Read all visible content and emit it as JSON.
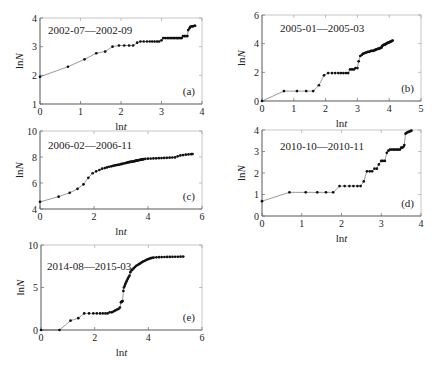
{
  "chart_data": [
    {
      "id": "a",
      "type": "line",
      "panel_label": "(a)",
      "title": "2002-07—2002-09",
      "xlabel": "lnt",
      "ylabel": "lnN",
      "xlim": [
        0,
        4
      ],
      "ylim": [
        1,
        4
      ],
      "xticks": [
        0,
        1,
        2,
        3,
        4
      ],
      "yticks": [
        1,
        2,
        3,
        4
      ],
      "grid": false,
      "box": {
        "x": 40,
        "y": 18,
        "w": 162,
        "h": 86
      },
      "x": [
        0,
        0.69,
        1.1,
        1.39,
        1.61,
        1.79,
        1.95,
        2.08,
        2.2,
        2.3,
        2.4,
        2.48,
        2.56,
        2.64,
        2.71,
        2.77,
        2.83,
        2.89,
        2.94,
        3.0,
        3.04,
        3.09,
        3.14,
        3.18,
        3.22,
        3.26,
        3.3,
        3.33,
        3.37,
        3.4,
        3.43,
        3.47,
        3.5,
        3.53,
        3.56,
        3.58,
        3.61,
        3.64,
        3.66,
        3.69,
        3.71,
        3.74,
        3.76,
        3.78,
        3.81,
        3.83
      ],
      "y": [
        1.95,
        2.3,
        2.56,
        2.77,
        2.83,
        3.0,
        3.04,
        3.04,
        3.04,
        3.04,
        3.14,
        3.18,
        3.18,
        3.18,
        3.18,
        3.18,
        3.18,
        3.18,
        3.18,
        3.22,
        3.3,
        3.3,
        3.3,
        3.3,
        3.3,
        3.3,
        3.3,
        3.3,
        3.3,
        3.3,
        3.3,
        3.3,
        3.3,
        3.37,
        3.37,
        3.37,
        3.37,
        3.37,
        3.58,
        3.64,
        3.69,
        3.71,
        3.71,
        3.71,
        3.73,
        3.73
      ]
    },
    {
      "id": "b",
      "type": "line",
      "panel_label": "(b)",
      "title": "2005-01—2005-03",
      "xlabel": "lnt",
      "ylabel": "lnN",
      "xlim": [
        0,
        5
      ],
      "ylim": [
        0,
        6
      ],
      "xticks": [
        0,
        1,
        2,
        3,
        4,
        5
      ],
      "yticks": [
        0,
        2,
        4,
        6
      ],
      "grid": false,
      "box": {
        "x": 262,
        "y": 15,
        "w": 159,
        "h": 86
      },
      "x": [
        0,
        0.69,
        1.1,
        1.39,
        1.61,
        1.79,
        1.95,
        2.08,
        2.2,
        2.3,
        2.4,
        2.48,
        2.56,
        2.64,
        2.71,
        2.77,
        2.83,
        2.89,
        2.94,
        3.0,
        3.04,
        3.09,
        3.14,
        3.18,
        3.22,
        3.26,
        3.3,
        3.33,
        3.37,
        3.4,
        3.43,
        3.47,
        3.5,
        3.53,
        3.56,
        3.58,
        3.61,
        3.64,
        3.66,
        3.69,
        3.71,
        3.74,
        3.76,
        3.78,
        3.81,
        3.83,
        3.85,
        3.87,
        3.89,
        3.91,
        3.93,
        3.95,
        3.97,
        3.99,
        4.01,
        4.03,
        4.05,
        4.07,
        4.09,
        4.11
      ],
      "y": [
        0,
        0.69,
        0.69,
        0.69,
        0.69,
        1.1,
        1.79,
        1.95,
        1.95,
        1.95,
        1.95,
        1.95,
        1.95,
        1.95,
        1.95,
        2.2,
        2.2,
        2.2,
        2.3,
        2.3,
        2.77,
        3.14,
        3.22,
        3.3,
        3.33,
        3.37,
        3.4,
        3.43,
        3.43,
        3.47,
        3.5,
        3.5,
        3.5,
        3.53,
        3.56,
        3.58,
        3.61,
        3.64,
        3.64,
        3.66,
        3.69,
        3.71,
        3.74,
        3.85,
        3.89,
        3.91,
        3.93,
        3.95,
        3.97,
        4.0,
        4.03,
        4.05,
        4.07,
        4.09,
        4.11,
        4.13,
        4.15,
        4.17,
        4.2,
        4.22
      ]
    },
    {
      "id": "c",
      "type": "line",
      "panel_label": "(c)",
      "title": "2006-02—2006-11",
      "xlabel": "lnt",
      "ylabel": "lnN",
      "xlim": [
        0,
        6
      ],
      "ylim": [
        4,
        10
      ],
      "xticks": [
        0,
        2,
        4,
        6
      ],
      "yticks": [
        4,
        6,
        8,
        10
      ],
      "grid": false,
      "box": {
        "x": 40,
        "y": 131,
        "w": 162,
        "h": 78
      },
      "x": [
        0,
        0.69,
        1.1,
        1.39,
        1.61,
        1.79,
        1.95,
        2.08,
        2.2,
        2.3,
        2.4,
        2.48,
        2.56,
        2.64,
        2.71,
        2.77,
        2.83,
        2.89,
        2.94,
        3.0,
        3.04,
        3.09,
        3.14,
        3.18,
        3.22,
        3.26,
        3.3,
        3.33,
        3.37,
        3.4,
        3.43,
        3.47,
        3.5,
        3.53,
        3.56,
        3.58,
        3.61,
        3.64,
        3.66,
        3.69,
        3.71,
        3.74,
        3.76,
        3.78,
        3.81,
        3.83,
        3.9,
        4.0,
        4.1,
        4.2,
        4.3,
        4.4,
        4.5,
        4.6,
        4.7,
        4.8,
        4.9,
        5.0,
        5.1,
        5.2,
        5.3,
        5.4,
        5.5,
        5.6,
        5.65
      ],
      "y": [
        4.55,
        4.95,
        5.25,
        5.55,
        5.9,
        6.4,
        6.75,
        6.9,
        7.0,
        7.1,
        7.15,
        7.2,
        7.25,
        7.28,
        7.32,
        7.35,
        7.38,
        7.4,
        7.42,
        7.45,
        7.47,
        7.5,
        7.52,
        7.54,
        7.56,
        7.58,
        7.6,
        7.62,
        7.63,
        7.64,
        7.65,
        7.66,
        7.68,
        7.7,
        7.72,
        7.73,
        7.74,
        7.75,
        7.76,
        7.77,
        7.78,
        7.79,
        7.8,
        7.81,
        7.82,
        7.83,
        7.85,
        7.87,
        7.88,
        7.89,
        7.9,
        7.91,
        7.92,
        7.93,
        7.94,
        7.95,
        7.96,
        7.97,
        8.05,
        8.12,
        8.15,
        8.18,
        8.2,
        8.22,
        8.23
      ]
    },
    {
      "id": "d",
      "type": "line",
      "panel_label": "(d)",
      "title": "2010-10—2010-11",
      "xlabel": "lnt",
      "ylabel": "lnN",
      "xlim": [
        0,
        4
      ],
      "ylim": [
        0,
        4
      ],
      "xticks": [
        0,
        1,
        2,
        3,
        4
      ],
      "yticks": [
        0,
        1,
        2,
        3,
        4
      ],
      "grid": false,
      "box": {
        "x": 262,
        "y": 130,
        "w": 159,
        "h": 86
      },
      "x": [
        0,
        0.69,
        1.1,
        1.39,
        1.61,
        1.79,
        1.95,
        2.08,
        2.2,
        2.3,
        2.4,
        2.48,
        2.56,
        2.64,
        2.71,
        2.77,
        2.83,
        2.89,
        2.94,
        3.0,
        3.04,
        3.09,
        3.14,
        3.18,
        3.22,
        3.26,
        3.3,
        3.33,
        3.37,
        3.4,
        3.43,
        3.47,
        3.5,
        3.53,
        3.56,
        3.58,
        3.61,
        3.64,
        3.66,
        3.69,
        3.71,
        3.74,
        3.76
      ],
      "y": [
        0.69,
        1.1,
        1.1,
        1.1,
        1.1,
        1.1,
        1.39,
        1.39,
        1.39,
        1.39,
        1.39,
        1.39,
        1.61,
        2.08,
        2.08,
        2.08,
        2.2,
        2.2,
        2.4,
        2.56,
        2.56,
        2.56,
        2.94,
        3.04,
        3.09,
        3.09,
        3.09,
        3.09,
        3.09,
        3.09,
        3.09,
        3.09,
        3.18,
        3.18,
        3.22,
        3.3,
        3.83,
        3.87,
        3.89,
        3.91,
        3.93,
        3.95,
        3.97
      ]
    },
    {
      "id": "e",
      "type": "line",
      "panel_label": "(e)",
      "title": "2014-08—2015-03",
      "xlabel": "lnt",
      "ylabel": "lnN",
      "xlim": [
        0,
        6
      ],
      "ylim": [
        0,
        10
      ],
      "xticks": [
        0,
        2,
        4,
        6
      ],
      "yticks": [
        0,
        5,
        10
      ],
      "grid": false,
      "box": {
        "x": 41,
        "y": 245,
        "w": 161,
        "h": 85
      },
      "x": [
        0,
        0.69,
        1.1,
        1.39,
        1.61,
        1.79,
        1.95,
        2.08,
        2.2,
        2.3,
        2.4,
        2.48,
        2.56,
        2.64,
        2.71,
        2.77,
        2.83,
        2.89,
        2.94,
        2.98,
        3.0,
        3.02,
        3.04,
        3.07,
        3.09,
        3.12,
        3.14,
        3.17,
        3.2,
        3.23,
        3.26,
        3.3,
        3.33,
        3.37,
        3.4,
        3.45,
        3.5,
        3.55,
        3.6,
        3.65,
        3.7,
        3.75,
        3.8,
        3.85,
        3.9,
        3.95,
        4.0,
        4.05,
        4.1,
        4.15,
        4.2,
        4.3,
        4.4,
        4.5,
        4.6,
        4.7,
        4.8,
        4.9,
        5.0,
        5.1,
        5.2,
        5.3
      ],
      "y": [
        0,
        0,
        1.1,
        1.39,
        1.95,
        1.95,
        1.95,
        1.95,
        1.95,
        1.95,
        1.95,
        1.95,
        2.08,
        2.08,
        2.2,
        2.3,
        2.4,
        2.48,
        2.64,
        3.26,
        3.3,
        3.37,
        3.4,
        4.6,
        5.0,
        5.2,
        5.4,
        5.6,
        5.8,
        6.0,
        6.2,
        6.4,
        6.8,
        7.0,
        7.1,
        7.25,
        7.4,
        7.55,
        7.65,
        7.75,
        7.85,
        7.95,
        8.05,
        8.12,
        8.2,
        8.28,
        8.35,
        8.4,
        8.45,
        8.5,
        8.52,
        8.55,
        8.57,
        8.58,
        8.59,
        8.6,
        8.6,
        8.61,
        8.62,
        8.62,
        8.63,
        8.64
      ]
    }
  ]
}
